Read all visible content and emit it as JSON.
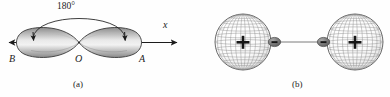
{
  "figure": {
    "background_color": "#fefefe",
    "ink_color": "#1c1c1c",
    "panels": [
      {
        "id": "panel-a",
        "caption": "(a)",
        "description": "Two shaded p-orbital lobes along a horizontal x axis with a 180 degree arc",
        "angle_label": "180°",
        "axis_label": "x",
        "point_labels": {
          "left": "B",
          "origin": "O",
          "right": "A"
        },
        "lobe_fill_light": "#e8e8e8",
        "lobe_fill_dark": "#9a9a9a",
        "lobe_outline": "#3a3a3a"
      },
      {
        "id": "panel-b",
        "caption": "(b)",
        "description": "Two wireframe mesh spheres marked plus joined by small dark ellipsoids marked minus",
        "sphere_sign": "+",
        "node_sign": "–",
        "mesh_color": "#8d8d8d",
        "sphere_outline": "#5a5a5a",
        "node_fill": "#6b6b6b"
      }
    ]
  }
}
